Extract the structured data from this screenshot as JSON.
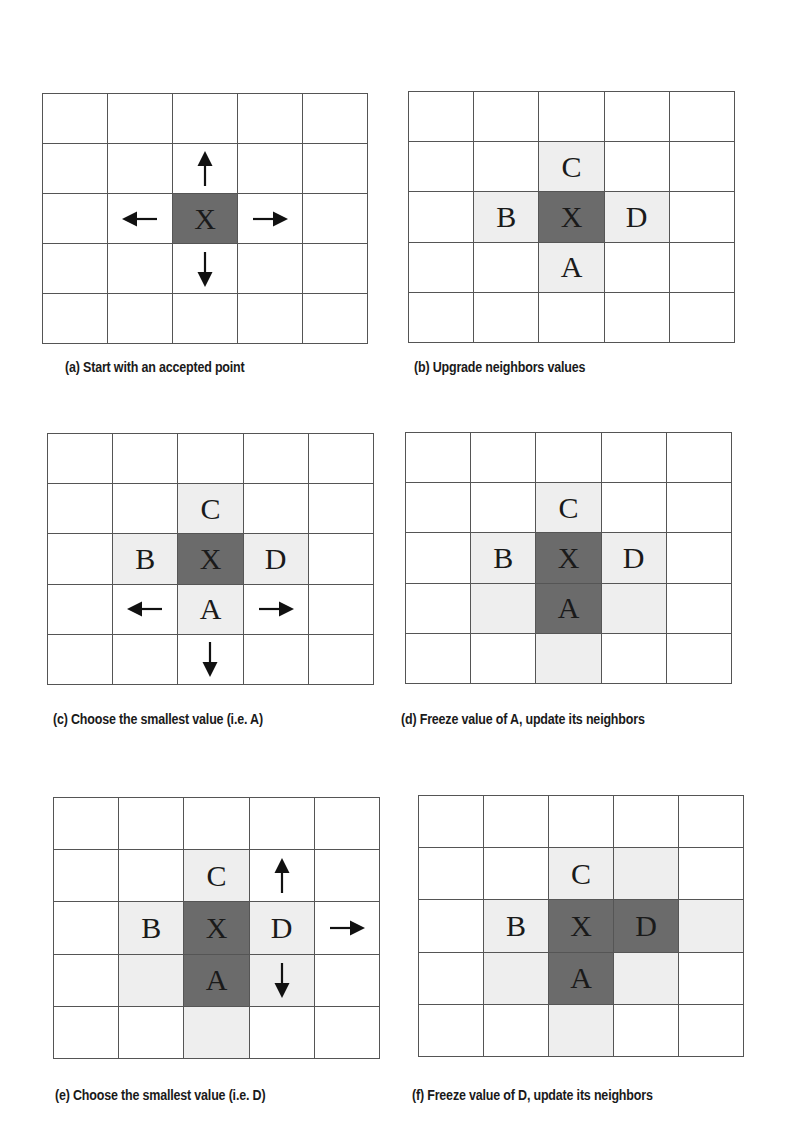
{
  "colors": {
    "grid_line": "#555555",
    "frozen_fill": "#6b6b6b",
    "trial_fill": "#eeeeee",
    "empty_fill": "#ffffff",
    "arrow": "#111111"
  },
  "panels": [
    {
      "id": "a",
      "caption": "(a) Start with an accepted point",
      "grid": {
        "x": 42,
        "y": 93,
        "w": 326,
        "h": 251
      },
      "caption_pos": {
        "x": 65,
        "y": 368
      },
      "cells": [
        {
          "row": 2,
          "col": 2,
          "state": "dark",
          "label": "X"
        }
      ],
      "arrows": [
        {
          "row": 1,
          "col": 2,
          "dir": "up"
        },
        {
          "row": 2,
          "col": 1,
          "dir": "left"
        },
        {
          "row": 2,
          "col": 3,
          "dir": "right"
        },
        {
          "row": 3,
          "col": 2,
          "dir": "down"
        }
      ]
    },
    {
      "id": "b",
      "caption": "(b) Upgrade neighbors values",
      "grid": {
        "x": 408,
        "y": 91,
        "w": 327,
        "h": 252
      },
      "caption_pos": {
        "x": 414,
        "y": 368
      },
      "cells": [
        {
          "row": 1,
          "col": 2,
          "state": "light",
          "label": "C"
        },
        {
          "row": 2,
          "col": 1,
          "state": "light",
          "label": "B"
        },
        {
          "row": 2,
          "col": 2,
          "state": "dark",
          "label": "X"
        },
        {
          "row": 2,
          "col": 3,
          "state": "light",
          "label": "D"
        },
        {
          "row": 3,
          "col": 2,
          "state": "light",
          "label": "A"
        }
      ],
      "arrows": []
    },
    {
      "id": "c",
      "caption": "(c) Choose the smallest value (i.e. A)",
      "grid": {
        "x": 47,
        "y": 433,
        "w": 327,
        "h": 252
      },
      "caption_pos": {
        "x": 53,
        "y": 720
      },
      "cells": [
        {
          "row": 1,
          "col": 2,
          "state": "light",
          "label": "C"
        },
        {
          "row": 2,
          "col": 1,
          "state": "light",
          "label": "B"
        },
        {
          "row": 2,
          "col": 2,
          "state": "dark",
          "label": "X"
        },
        {
          "row": 2,
          "col": 3,
          "state": "light",
          "label": "D"
        },
        {
          "row": 3,
          "col": 2,
          "state": "light",
          "label": "A"
        }
      ],
      "arrows": [
        {
          "row": 3,
          "col": 1,
          "dir": "left"
        },
        {
          "row": 3,
          "col": 3,
          "dir": "right"
        },
        {
          "row": 4,
          "col": 2,
          "dir": "down"
        }
      ]
    },
    {
      "id": "d",
      "caption": "(d) Freeze value of A, update its neighbors",
      "grid": {
        "x": 405,
        "y": 432,
        "w": 327,
        "h": 252
      },
      "caption_pos": {
        "x": 401,
        "y": 720
      },
      "cells": [
        {
          "row": 1,
          "col": 2,
          "state": "light",
          "label": "C"
        },
        {
          "row": 2,
          "col": 1,
          "state": "light",
          "label": "B"
        },
        {
          "row": 2,
          "col": 2,
          "state": "dark",
          "label": "X"
        },
        {
          "row": 2,
          "col": 3,
          "state": "light",
          "label": "D"
        },
        {
          "row": 3,
          "col": 1,
          "state": "light",
          "label": ""
        },
        {
          "row": 3,
          "col": 2,
          "state": "dark",
          "label": "A"
        },
        {
          "row": 3,
          "col": 3,
          "state": "light",
          "label": ""
        },
        {
          "row": 4,
          "col": 2,
          "state": "light",
          "label": ""
        }
      ],
      "arrows": []
    },
    {
      "id": "e",
      "caption": "(e) Choose the smallest value (i.e. D)",
      "grid": {
        "x": 53,
        "y": 797,
        "w": 327,
        "h": 262
      },
      "caption_pos": {
        "x": 55,
        "y": 1096
      },
      "cells": [
        {
          "row": 1,
          "col": 2,
          "state": "light",
          "label": "C"
        },
        {
          "row": 2,
          "col": 1,
          "state": "light",
          "label": "B"
        },
        {
          "row": 2,
          "col": 2,
          "state": "dark",
          "label": "X"
        },
        {
          "row": 2,
          "col": 3,
          "state": "light",
          "label": "D"
        },
        {
          "row": 3,
          "col": 1,
          "state": "light",
          "label": ""
        },
        {
          "row": 3,
          "col": 2,
          "state": "dark",
          "label": "A"
        },
        {
          "row": 3,
          "col": 3,
          "state": "light",
          "label": ""
        },
        {
          "row": 4,
          "col": 2,
          "state": "light",
          "label": ""
        }
      ],
      "arrows": [
        {
          "row": 1,
          "col": 3,
          "dir": "up"
        },
        {
          "row": 2,
          "col": 4,
          "dir": "right"
        },
        {
          "row": 3,
          "col": 3,
          "dir": "down"
        }
      ]
    },
    {
      "id": "f",
      "caption": "(f) Freeze value of D, update its neighbors",
      "grid": {
        "x": 418,
        "y": 795,
        "w": 326,
        "h": 262
      },
      "caption_pos": {
        "x": 412,
        "y": 1096
      },
      "cells": [
        {
          "row": 1,
          "col": 2,
          "state": "light",
          "label": "C"
        },
        {
          "row": 1,
          "col": 3,
          "state": "light",
          "label": ""
        },
        {
          "row": 2,
          "col": 1,
          "state": "light",
          "label": "B"
        },
        {
          "row": 2,
          "col": 2,
          "state": "dark",
          "label": "X"
        },
        {
          "row": 2,
          "col": 3,
          "state": "dark",
          "label": "D"
        },
        {
          "row": 2,
          "col": 4,
          "state": "light",
          "label": ""
        },
        {
          "row": 3,
          "col": 1,
          "state": "light",
          "label": ""
        },
        {
          "row": 3,
          "col": 2,
          "state": "dark",
          "label": "A"
        },
        {
          "row": 3,
          "col": 3,
          "state": "light",
          "label": ""
        },
        {
          "row": 4,
          "col": 2,
          "state": "light",
          "label": ""
        }
      ],
      "arrows": []
    }
  ]
}
